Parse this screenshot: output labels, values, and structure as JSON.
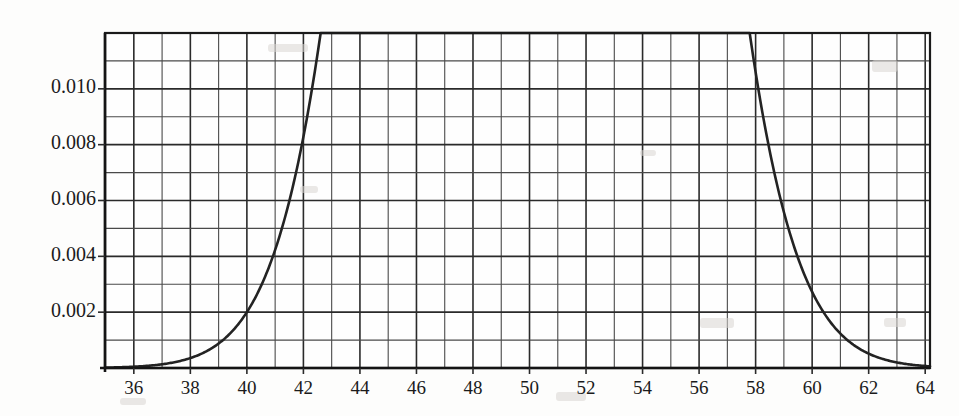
{
  "chart_data": {
    "type": "line",
    "title": "",
    "subtitle": "",
    "xlabel": "",
    "ylabel": "",
    "xlim": [
      34.98,
      64.17
    ],
    "ylim": [
      0,
      0.012
    ],
    "grid": true,
    "legend": null,
    "annotations": [],
    "distribution": {
      "family": "normal",
      "mean": 50.2,
      "sigma": 3.6,
      "peak_value": 0.0111,
      "peak_x": 50.2
    },
    "x_ticks": [
      36,
      38,
      40,
      42,
      44,
      46,
      48,
      50,
      52,
      54,
      56,
      58,
      60,
      62,
      64
    ],
    "x_tick_labels": [
      "36",
      "38",
      "40",
      "42",
      "44",
      "46",
      "48",
      "50",
      "52",
      "54",
      "56",
      "58",
      "60",
      "62",
      "64"
    ],
    "x_minor_step": 1,
    "y_ticks": [
      0.002,
      0.004,
      0.006,
      0.008,
      0.01
    ],
    "y_tick_labels": [
      "0.002",
      "0.004",
      "0.006",
      "0.008",
      "0.010"
    ],
    "y_grid_step": 0.001,
    "series": [
      {
        "name": "normal-density",
        "x": [
          35,
          36,
          37,
          38,
          39,
          40,
          41,
          42,
          43,
          44,
          45,
          46,
          47,
          48,
          49,
          50,
          50.2,
          51,
          52,
          53,
          54,
          55,
          56,
          57,
          58,
          59,
          60,
          61,
          62,
          63,
          64
        ],
        "values": [
          2e-05,
          5e-05,
          0.00012,
          0.00026,
          0.00053,
          0.001,
          0.00177,
          0.00292,
          0.0045,
          0.00644,
          0.00859,
          0.01065,
          0.011,
          0.01108,
          0.011,
          0.0111,
          0.01108,
          0.01081,
          0.00973,
          0.00815,
          0.00634,
          0.00458,
          0.00307,
          0.00191,
          0.00111,
          0.0006,
          0.0003,
          0.00014,
          6e-05,
          2e-05,
          1e-05
        ]
      }
    ],
    "colors": {
      "curve": "#232323",
      "grid_major": "#2a2a2a",
      "grid_minor": "#4a4a4a",
      "frame": "#1a1a1a",
      "background": "#fdfdfc",
      "text": "#1b1b1b"
    }
  },
  "figure": {
    "plot_left": 105,
    "plot_right": 930,
    "plot_top": 33,
    "plot_bottom": 368
  }
}
